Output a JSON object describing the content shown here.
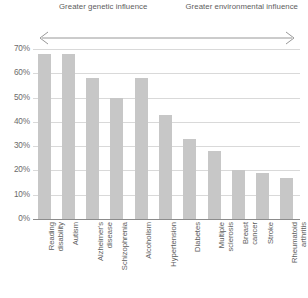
{
  "annotation": {
    "left_text": "Greater genetic influence",
    "right_text": "Greater environmental influence",
    "arrow_name": "double-headed-arrow"
  },
  "axis": {
    "yticks": [
      "0%",
      "10%",
      "20%",
      "30%",
      "40%",
      "50%",
      "60%",
      "70%"
    ]
  },
  "colors": {
    "bar": "#c7c7c7",
    "gridline": "#d9d9d9",
    "axis": "#8c8c8c",
    "text": "#5d5d5d"
  },
  "chart_data": {
    "type": "bar",
    "title": "",
    "subtitle": "",
    "xlabel": "",
    "ylabel": "",
    "ylim": [
      0,
      70
    ],
    "ytick_step": 10,
    "grid": true,
    "legend": "none",
    "categories": [
      "Reading disability",
      "Autism",
      "Alzheimer's disease",
      "Schizophrenia",
      "Alcoholism",
      "Hypertension",
      "Diabetes",
      "Multiple sclerosis",
      "Breast cancer",
      "Stroke",
      "Rheumatoid arthritis"
    ],
    "category_lines": [
      "Reading\ndisability",
      "Autism",
      "Alzheimer's\ndisease",
      "Schizophrenia",
      "Alcoholism",
      "Hypertension",
      "Diabetes",
      "Multiple\nsclerosis",
      "Breast\ncancer",
      "Stroke",
      "Rheumatoid\narthritis"
    ],
    "values": [
      68,
      68,
      58,
      50,
      58,
      43,
      33,
      28,
      20,
      19,
      17
    ],
    "annotations": [
      "Greater genetic influence",
      "Greater environmental influence"
    ]
  }
}
